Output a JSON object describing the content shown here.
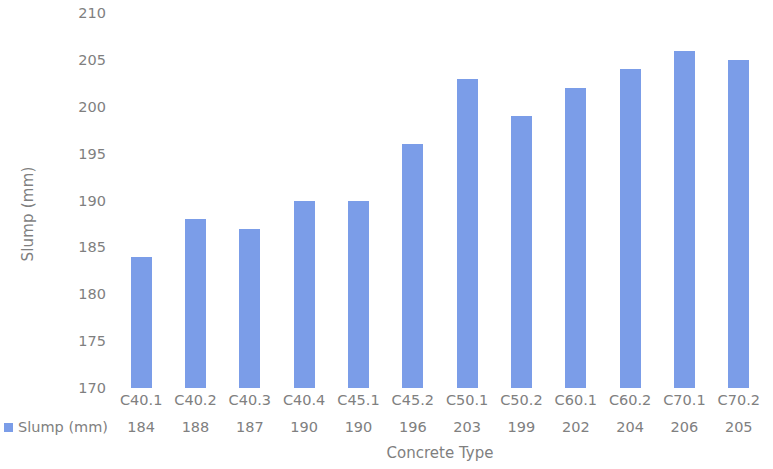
{
  "chart_data": {
    "type": "bar",
    "title": "",
    "xlabel": "Concrete Type",
    "ylabel": "Slump (mm)",
    "categories": [
      "C40.1",
      "C40.2",
      "C40.3",
      "C40.4",
      "C45.1",
      "C45.2",
      "C50.1",
      "C50.2",
      "C60.1",
      "C60.2",
      "C70.1",
      "C70.2"
    ],
    "values": [
      184,
      188,
      187,
      190,
      190,
      196,
      203,
      199,
      202,
      204,
      206,
      205
    ],
    "series": [
      {
        "name": "Slump (mm)",
        "values": [
          184,
          188,
          187,
          190,
          190,
          196,
          203,
          199,
          202,
          204,
          206,
          205
        ],
        "color": "#7b9de8"
      }
    ],
    "ylim": [
      170,
      210
    ],
    "ytick_labels": [
      "210",
      "205",
      "200",
      "195",
      "190",
      "185",
      "180",
      "175",
      "170"
    ],
    "yticks": [
      210,
      205,
      200,
      195,
      190,
      185,
      180,
      175,
      170
    ],
    "grid": false,
    "legend_position": "bottom-left",
    "legend": [
      "Slump (mm)"
    ],
    "data_table_visible": true,
    "bar_color": "#7b9de8",
    "text_color": "#808080",
    "background_color": "#ffffff"
  }
}
